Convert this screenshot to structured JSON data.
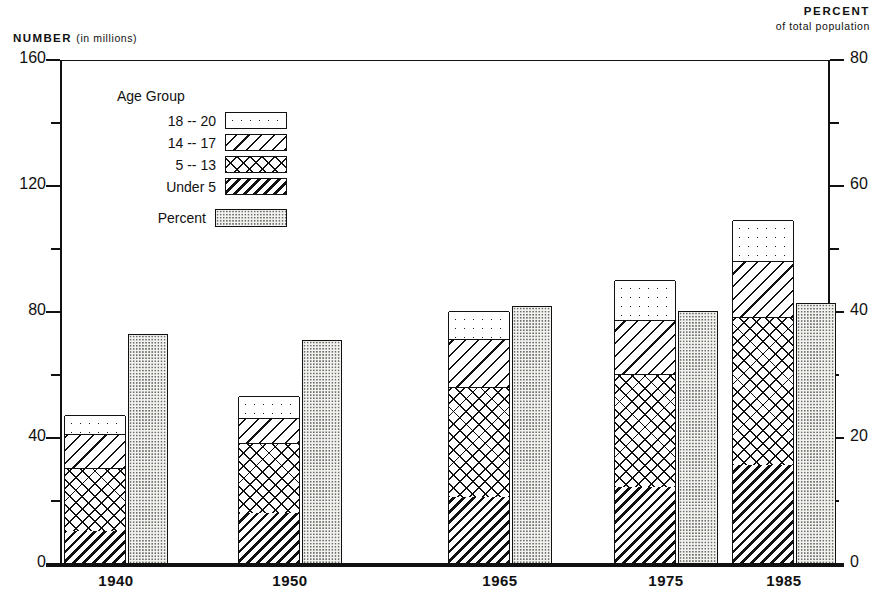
{
  "axes": {
    "left_caption_bold": "NUMBER",
    "left_caption_light": "(in millions)",
    "right_caption_bold": "PERCENT",
    "right_caption_light": "of total population",
    "left_ticks": [
      "0",
      "40",
      "80",
      "120",
      "160"
    ],
    "right_ticks": [
      "0",
      "20",
      "40",
      "60",
      "80"
    ]
  },
  "legend": {
    "title": "Age Group",
    "items": [
      {
        "label": "18 -- 20",
        "pattern": "pat-dots"
      },
      {
        "label": "14 -- 17",
        "pattern": "pat-diag"
      },
      {
        "label": "5 -- 13",
        "pattern": "pat-cross"
      },
      {
        "label": "Under 5",
        "pattern": "pat-dense"
      }
    ],
    "percent_label": "Percent",
    "percent_pattern": "pat-stipple"
  },
  "chart_data": {
    "type": "bar",
    "title": "",
    "subtype": "stacked-bar-with-paired-percent-bar",
    "categories": [
      "1940",
      "1950",
      "1965",
      "1975",
      "1985"
    ],
    "xlabel": "",
    "ylabel": "NUMBER (in millions)",
    "ylim": [
      0,
      160
    ],
    "y_ticks": [
      0,
      40,
      80,
      120,
      160
    ],
    "y2label": "PERCENT of total population",
    "y2lim": [
      0,
      80
    ],
    "y2_ticks": [
      0,
      20,
      40,
      60,
      80
    ],
    "grid": false,
    "legend_position": "upper-left-inside",
    "series": [
      {
        "name": "Under 5",
        "axis": "left",
        "values": [
          10,
          16,
          21,
          24,
          31
        ]
      },
      {
        "name": "5 -- 13",
        "axis": "left",
        "values": [
          20,
          22,
          35,
          36,
          47
        ]
      },
      {
        "name": "14 -- 17",
        "axis": "left",
        "values": [
          11,
          8,
          15,
          17,
          18
        ]
      },
      {
        "name": "18 -- 20",
        "axis": "left",
        "values": [
          6,
          7,
          9,
          13,
          13
        ]
      }
    ],
    "totals": [
      47,
      53,
      80,
      90,
      109
    ],
    "percent_series": {
      "name": "Percent",
      "axis": "right",
      "values": [
        36.5,
        35.5,
        41.0,
        40.2,
        41.5
      ]
    }
  }
}
